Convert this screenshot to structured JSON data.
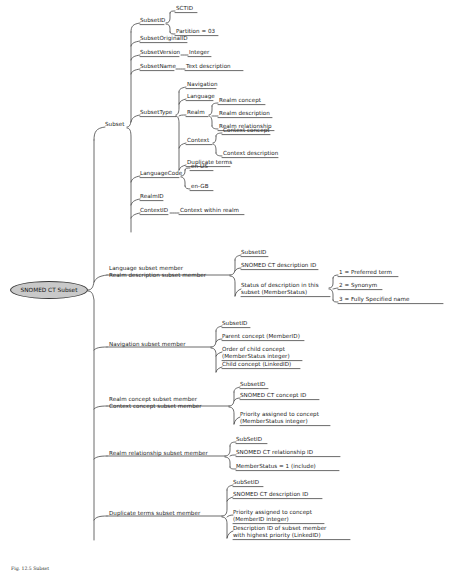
{
  "diagram": {
    "title": "SNOMED CT Subset",
    "type": "mind-map",
    "root": {
      "label": "SNOMED CT Subset",
      "fill": "#c9c9c9",
      "stroke": "#3a3a3a"
    },
    "caption": "Fig. 12.5 Subset",
    "line_color": "#3a3a3a",
    "text_color": "#1b1b1b"
  },
  "nodes": {
    "subset": "Subset",
    "subset_id": "SubsetID",
    "sctid": "SCTID",
    "partition": "Partition = 03",
    "subset_original_id": "SubsetOriginalID",
    "subset_version": "SubsetVersion",
    "integer": "Integer",
    "subset_name": "SubsetName",
    "text_description": "Text description",
    "subset_type": "SubsetType",
    "navigation": "Navigation",
    "language": "Language",
    "realm": "Realm",
    "realm_concept": "Realm concept",
    "realm_description": "Realm description",
    "realm_relationship": "Realm relationship",
    "context": "Context",
    "context_concept": "Context concept",
    "context_description": "Context description",
    "duplicate_terms": "Duplicate terms",
    "language_code": "LanguageCode",
    "en_us": "en-US",
    "en_gb": "en-GB",
    "realm_id": "RealmID",
    "context_id": "ContextID",
    "context_within_realm": "Context within realm",
    "language_member": "Language subset member\nRealm description subset member",
    "lm_subset_id": "SubsetID",
    "lm_description_id": "SNOMED CT description ID",
    "lm_status": "Status of description in this\nsubset (MemberStatus)",
    "status_1": "1 = Preferred term",
    "status_2": "2 = Synonym",
    "status_3": "3 = Fully Specified name",
    "navigation_member": "Navigation subset member",
    "nm_subset_id": "SubsetID",
    "nm_parent": "Parent concept (MemberID)",
    "nm_order": "Order of child concept\n(MemberStatus integer)",
    "nm_child": "Child concept (LinkedID)",
    "concept_member": "Realm concept subset member\nContext concept subset member",
    "cm_subset_id": "SubsetID",
    "cm_concept_id": "SNOMED CT concept ID",
    "cm_priority": "Priority assigned to concept\n(MemberStatus integer)",
    "relationship_member": "Realm relationship subset member",
    "rm_subset_id": "SubSetID",
    "rm_relationship_id": "SNOMED CT relationship ID",
    "rm_status": "MemberStatus = 1 (include)",
    "duplicate_member": "Duplicate terms subset member",
    "dm_subset_id": "SubSetID",
    "dm_description_id": "SNOMED CT description ID",
    "dm_priority": "Priority assigned to concept\n(MemberID integer)",
    "dm_highest": "Description ID of subset member\nwith highest priority (LinkedID)"
  }
}
